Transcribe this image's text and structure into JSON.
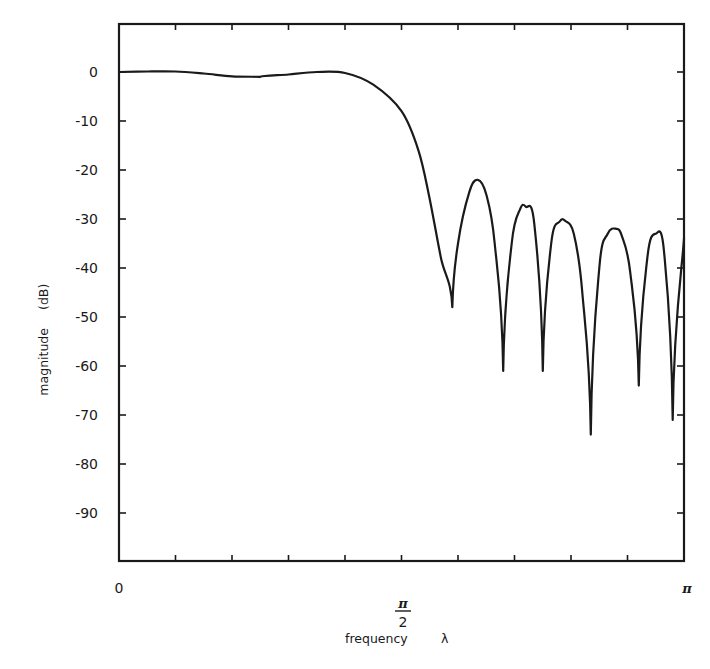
{
  "chart_data": {
    "type": "line",
    "title": "",
    "xlabel": "frequency λ",
    "ylabel": "magnitude (dB)",
    "xlim": [
      0,
      3.14159
    ],
    "ylim": [
      -100,
      10
    ],
    "grid": false,
    "legend": null,
    "x_tick_labels": [
      {
        "value": 0,
        "label": "0"
      },
      {
        "value": 1.5708,
        "label": "π/2",
        "numerator": "π",
        "denominator": "2"
      },
      {
        "value": 3.14159,
        "label": "π"
      }
    ],
    "x_minor_ticks": 10,
    "y_ticks": [
      0,
      -10,
      -20,
      -30,
      -40,
      -50,
      -60,
      -70,
      -80,
      -90
    ],
    "y_tick_labels": [
      "0",
      "-10",
      "-20",
      "-30",
      "-40",
      "-50",
      "-60",
      "-70",
      "-80",
      "-90"
    ],
    "series": [
      {
        "name": "magnitude response",
        "x_fraction_of_pi": [
          0.0,
          0.05,
          0.1,
          0.15,
          0.2,
          0.25,
          0.3,
          0.35,
          0.4,
          0.45,
          0.5,
          0.53,
          0.55,
          0.57,
          0.59,
          0.6,
          0.62,
          0.635,
          0.65,
          0.665,
          0.68,
          0.695,
          0.71,
          0.72,
          0.735,
          0.75,
          0.765,
          0.78,
          0.79,
          0.805,
          0.82,
          0.835,
          0.85,
          0.865,
          0.88,
          0.89,
          0.905,
          0.92,
          0.935,
          0.95,
          0.965,
          0.98,
          1.0
        ],
        "values_db": [
          0.0,
          0.1,
          0.1,
          -0.3,
          -0.9,
          -1.0,
          -0.5,
          0.0,
          -0.2,
          -2.6,
          -8.0,
          -16.0,
          -26.0,
          -38.0,
          -48.0,
          -35.0,
          -24.5,
          -22.0,
          -25.0,
          -35.0,
          -61.0,
          -35.0,
          -28.0,
          -27.5,
          -31.0,
          -61.0,
          -35.0,
          -30.5,
          -30.4,
          -33.0,
          -45.0,
          -74.0,
          -40.0,
          -33.0,
          -32.0,
          -33.5,
          -41.0,
          -64.0,
          -38.0,
          -33.0,
          -37.0,
          -71.0,
          -34.0
        ],
        "nulls": [
          {
            "x_fraction_of_pi": 0.46,
            "db": -48
          },
          {
            "x_fraction_of_pi": 0.555,
            "db": -61
          },
          {
            "x_fraction_of_pi": 0.653,
            "db": -61
          },
          {
            "x_fraction_of_pi": 0.75,
            "db": -74
          },
          {
            "x_fraction_of_pi": 0.848,
            "db": -64
          },
          {
            "x_fraction_of_pi": 0.95,
            "db": -71
          }
        ],
        "sidelobe_peaks": [
          {
            "x_fraction_of_pi": 0.5,
            "db": -22
          },
          {
            "x_fraction_of_pi": 0.6,
            "db": -27.5
          },
          {
            "x_fraction_of_pi": 0.695,
            "db": -30.4
          },
          {
            "x_fraction_of_pi": 0.795,
            "db": -32
          },
          {
            "x_fraction_of_pi": 0.895,
            "db": -33
          },
          {
            "x_fraction_of_pi": 1.0,
            "db": -34
          }
        ],
        "color": "#1a1a1a"
      }
    ]
  },
  "axes": {
    "x_label_text": "frequency",
    "x_label_symbol": "λ",
    "y_label_text": "magnitude",
    "y_label_unit": "(dB)",
    "x_tick_zero": "0",
    "x_tick_half_num": "π",
    "x_tick_half_den": "2",
    "x_tick_pi": "π"
  }
}
